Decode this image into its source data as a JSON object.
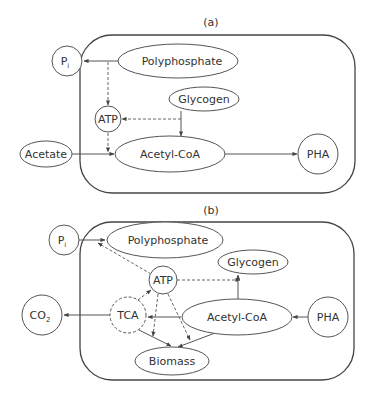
{
  "panels": [
    {
      "label": "(a)",
      "nodes": {
        "pi": {
          "label": "P",
          "sub": "i"
        },
        "polyphosphate": {
          "label": "Polyphosphate"
        },
        "glycogen": {
          "label": "Glycogen"
        },
        "atp": {
          "label": "ATP"
        },
        "acetate": {
          "label": "Acetate"
        },
        "acetyl_coa": {
          "label": "Acetyl-CoA"
        },
        "pha": {
          "label": "PHA"
        }
      },
      "edges": [
        {
          "from": "Polyphosphate",
          "to": "Pi",
          "style": "solid"
        },
        {
          "from": "Polyphosphate",
          "to": "ATP",
          "style": "dashed"
        },
        {
          "from": "Glycogen",
          "to": "ATP",
          "style": "dashed"
        },
        {
          "from": "Glycogen",
          "to": "Acetyl-CoA",
          "style": "solid"
        },
        {
          "from": "ATP",
          "to": "Acetate→Acetyl-CoA",
          "style": "dashed"
        },
        {
          "from": "Acetate",
          "to": "Acetyl-CoA",
          "style": "solid"
        },
        {
          "from": "Acetyl-CoA",
          "to": "PHA",
          "style": "solid"
        }
      ]
    },
    {
      "label": "(b)",
      "nodes": {
        "pi": {
          "label": "P",
          "sub": "i"
        },
        "polyphosphate": {
          "label": "Polyphosphate"
        },
        "glycogen": {
          "label": "Glycogen"
        },
        "atp": {
          "label": "ATP"
        },
        "co2": {
          "label": "CO",
          "sub": "2"
        },
        "tca": {
          "label": "TCA"
        },
        "acetyl_coa": {
          "label": "Acetyl-CoA"
        },
        "pha": {
          "label": "PHA"
        },
        "biomass": {
          "label": "Biomass"
        }
      },
      "edges": [
        {
          "from": "Pi",
          "to": "Polyphosphate",
          "style": "solid"
        },
        {
          "from": "ATP",
          "to": "Pi→Polyphosphate",
          "style": "dashed"
        },
        {
          "from": "ATP",
          "to": "Glycogen",
          "style": "dashed"
        },
        {
          "from": "Acetyl-CoA",
          "to": "Glycogen",
          "style": "solid"
        },
        {
          "from": "PHA",
          "to": "Acetyl-CoA",
          "style": "solid"
        },
        {
          "from": "Acetyl-CoA",
          "to": "TCA",
          "style": "solid"
        },
        {
          "from": "TCA",
          "to": "CO2",
          "style": "solid"
        },
        {
          "from": "TCA",
          "to": "ATP",
          "style": "dashed"
        },
        {
          "from": "ATP",
          "to": "Biomass",
          "style": "dashed"
        },
        {
          "from": "TCA",
          "to": "Biomass",
          "style": "solid"
        },
        {
          "from": "Acetyl-CoA",
          "to": "Biomass",
          "style": "solid"
        }
      ]
    }
  ]
}
